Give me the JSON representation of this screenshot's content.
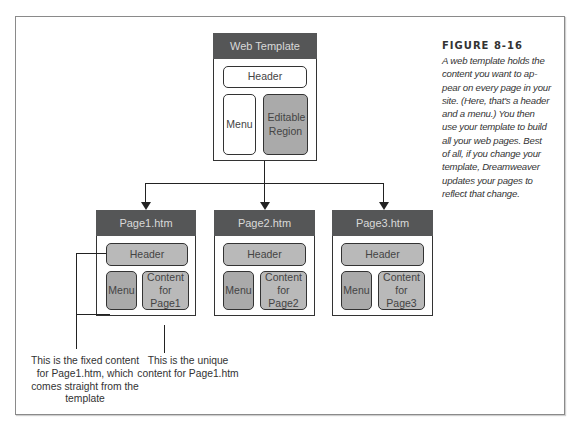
{
  "figure": {
    "label": "FIGURE 8-16",
    "caption": "A web template holds the content you want to appear on every page in your site. (Here, that's a header and a menu.) You then use your template to build all your web pages. Best of all, if you change your template, Dreamweaver updates your pages to reflect that change.",
    "caption_lines": [
      "A web template holds the",
      "content you want to ap-",
      "pear on every page in your",
      "site. (Here, that's a header",
      "and a menu.) You then",
      "use your template to build",
      "all your web pages. Best",
      "of all, if you change your",
      "template, Dreamweaver",
      "updates your pages to",
      "reflect that change."
    ]
  },
  "template": {
    "title": "Web Template",
    "header": "Header",
    "menu": "Menu",
    "editable_region": "Editable Region"
  },
  "pages": [
    {
      "title": "Page1.htm",
      "header": "Header",
      "menu": "Menu",
      "content": "Content for Page1"
    },
    {
      "title": "Page2.htm",
      "header": "Header",
      "menu": "Menu",
      "content": "Content for Page2"
    },
    {
      "title": "Page3.htm",
      "header": "Header",
      "menu": "Menu",
      "content": "Content for Page3"
    }
  ],
  "annotations": {
    "fixed": "This is the fixed content for Page1.htm, which comes straight from the template",
    "unique": "This is the unique content for Page1.htm"
  },
  "colors": {
    "title_bar": "#555657",
    "editable_fill": "#aaaaaa",
    "page_fill": "#b9b9b9"
  }
}
